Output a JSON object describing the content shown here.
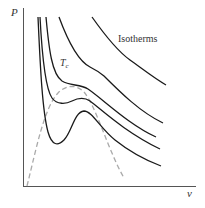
{
  "diagram": {
    "title": "",
    "type": "pv-isotherms",
    "axes": {
      "y_label": "P",
      "x_label": "v"
    },
    "labels": {
      "isotherms": "Isotherms",
      "critical": "T",
      "critical_subscript": "c"
    },
    "colors": {
      "axis": "#555555",
      "isotherm": "#1a1a1a",
      "coexistence": "#aaaaaa",
      "text": "#333333"
    },
    "curves": [
      {
        "name": "isotherm-below-critical-1",
        "style": "solid"
      },
      {
        "name": "isotherm-below-critical-2",
        "style": "solid"
      },
      {
        "name": "isotherm-critical",
        "style": "solid"
      },
      {
        "name": "isotherm-above-critical-1",
        "style": "solid"
      },
      {
        "name": "isotherm-above-critical-2",
        "style": "solid"
      },
      {
        "name": "coexistence-dome",
        "style": "dashed"
      }
    ]
  }
}
